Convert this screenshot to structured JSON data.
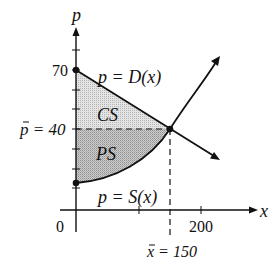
{
  "diagram": {
    "axes": {
      "x_label": "x",
      "y_label": "p",
      "origin_label": "0",
      "x_tick_label": "200",
      "y_tick_label": "70"
    },
    "curves": {
      "demand_label": "p = D(x)",
      "supply_label": "p = S(x)"
    },
    "regions": {
      "consumer_surplus": "CS",
      "producer_surplus": "PS"
    },
    "equilibrium": {
      "price_label": "p = 40",
      "quantity_label": "x = 150",
      "price_bar": "p",
      "quantity_bar": "x"
    },
    "values": {
      "demand_intercept": 70,
      "equilibrium_price": 40,
      "equilibrium_quantity": 150,
      "x_tick": 200
    },
    "colors": {
      "line": "#111111",
      "cs_fill": "#d8d8d8",
      "ps_fill": "#bdbdbd"
    }
  }
}
